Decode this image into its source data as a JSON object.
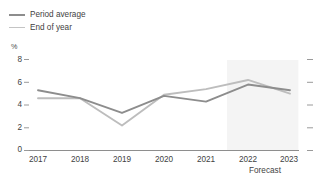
{
  "legend": {
    "items": [
      {
        "label": "Period average",
        "color": "#8d8d8d"
      },
      {
        "label": "End of year",
        "color": "#bdbdbd"
      }
    ]
  },
  "axes": {
    "unit": "%",
    "y_ticks": [
      "8",
      "6",
      "4",
      "2",
      "0"
    ],
    "x_ticks": [
      "2017",
      "2018",
      "2019",
      "2020",
      "2021",
      "2022",
      "2023"
    ],
    "forecast_label": "Forecast"
  },
  "chart_data": {
    "type": "line",
    "title": "",
    "xlabel": "",
    "ylabel": "%",
    "ylim": [
      0,
      8
    ],
    "yticks": [
      0,
      2,
      4,
      6,
      8
    ],
    "grid": false,
    "legend_position": "top-left",
    "categories": [
      "2017",
      "2018",
      "2019",
      "2020",
      "2021",
      "2022",
      "2023"
    ],
    "series": [
      {
        "name": "Period average",
        "color": "#8d8d8d",
        "values": [
          5.3,
          4.6,
          3.3,
          4.8,
          4.3,
          5.8,
          5.3
        ]
      },
      {
        "name": "End of year",
        "color": "#bdbdbd",
        "values": [
          4.6,
          4.6,
          2.2,
          4.9,
          5.4,
          6.2,
          5.0
        ]
      }
    ],
    "annotations": [
      {
        "type": "shaded-region",
        "label": "Forecast",
        "x_start": 2021.5,
        "x_end": 2023.2,
        "color": "#f4f4f4"
      }
    ]
  }
}
